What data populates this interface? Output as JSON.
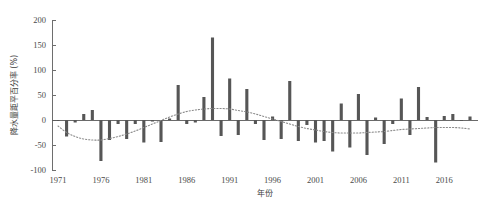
{
  "chart_data": {
    "type": "bar",
    "title": "",
    "subtitle": "",
    "xlabel": "年份",
    "ylabel": "降水量距平百分率 (%)",
    "xlim": [
      1970.2,
      2019.8
    ],
    "ylim": [
      -100,
      200
    ],
    "yticks": [
      -100,
      -50,
      0,
      50,
      100,
      150,
      200
    ],
    "ytick_labels": [
      "-100",
      "-50",
      "0",
      "50",
      "100",
      "150",
      "200"
    ],
    "xticks": [
      1971,
      1976,
      1981,
      1986,
      1991,
      1996,
      2001,
      2006,
      2011,
      2016
    ],
    "xtick_labels": [
      "1971",
      "1976",
      "1981",
      "1986",
      "1991",
      "1996",
      "2001",
      "2006",
      "2011",
      "2016"
    ],
    "grid": false,
    "legend": false,
    "bar_color": "#565656",
    "trend_color": "#8a8a8a",
    "categories": [
      1971,
      1972,
      1973,
      1974,
      1975,
      1976,
      1977,
      1978,
      1979,
      1980,
      1981,
      1982,
      1983,
      1984,
      1985,
      1986,
      1987,
      1988,
      1989,
      1990,
      1991,
      1992,
      1993,
      1994,
      1995,
      1996,
      1997,
      1998,
      1999,
      2000,
      2001,
      2002,
      2003,
      2004,
      2005,
      2006,
      2007,
      2008,
      2009,
      2010,
      2011,
      2012,
      2013,
      2014,
      2015,
      2016,
      2017,
      2018,
      2019
    ],
    "values": [
      -2,
      -33,
      -5,
      12,
      20,
      -82,
      -40,
      -8,
      -38,
      -8,
      -45,
      -3,
      -44,
      3,
      70,
      -8,
      -5,
      46,
      165,
      -32,
      83,
      -30,
      62,
      -8,
      -40,
      7,
      -38,
      78,
      -42,
      -10,
      -45,
      -42,
      -63,
      33,
      -55,
      52,
      -70,
      5,
      -48,
      -8,
      43,
      -30,
      66,
      6,
      -85,
      8,
      12,
      -2,
      7
    ],
    "series": [
      {
        "name": "降水量距平百分率",
        "type": "bar",
        "values": [
          -2,
          -33,
          -5,
          12,
          20,
          -82,
          -40,
          -8,
          -38,
          -8,
          -45,
          -3,
          -44,
          3,
          70,
          -8,
          -5,
          46,
          165,
          -32,
          83,
          -30,
          62,
          -8,
          -40,
          7,
          -38,
          78,
          -42,
          -10,
          -45,
          -42,
          -63,
          33,
          -55,
          52,
          -70,
          5,
          -48,
          -8,
          43,
          -30,
          66,
          6,
          -85,
          8,
          12,
          -2,
          7
        ]
      },
      {
        "name": "多项式趋势线",
        "type": "line",
        "style": "dotted",
        "values": [
          -12,
          -25,
          -33,
          -38,
          -40,
          -40,
          -37,
          -33,
          -28,
          -22,
          -15,
          -8,
          -1,
          6,
          12,
          17,
          20,
          22,
          23,
          23,
          22,
          19,
          16,
          12,
          7,
          2,
          -3,
          -8,
          -13,
          -17,
          -20,
          -23,
          -25,
          -26,
          -26,
          -26,
          -25,
          -24,
          -23,
          -21,
          -19,
          -18,
          -17,
          -16,
          -15,
          -15,
          -15,
          -16,
          -18
        ]
      }
    ],
    "annotations": []
  },
  "axes": {
    "y_title": "降水量距平百分率 (%)",
    "x_title": "年份"
  }
}
